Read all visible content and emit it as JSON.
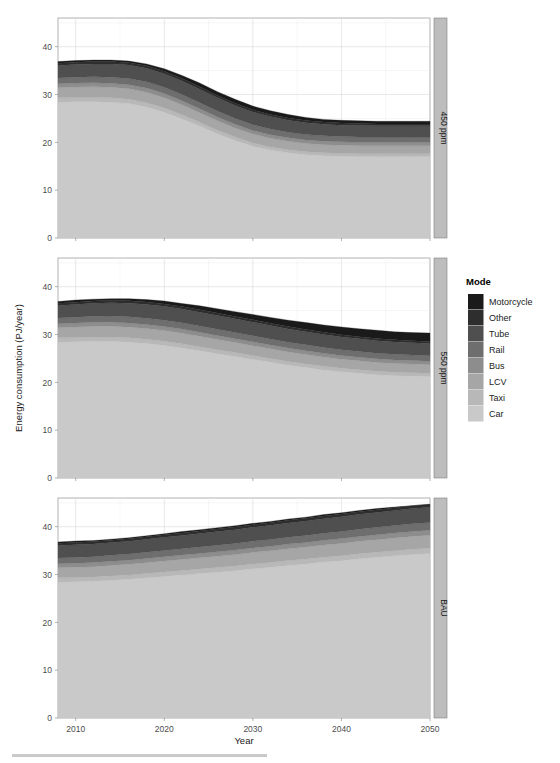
{
  "chart_data": {
    "type": "area",
    "stacked": true,
    "title": "",
    "xlabel": "Year",
    "ylabel": "Energy consumption (PJ/year)",
    "xlim": [
      2008,
      2050
    ],
    "ylim": [
      0,
      46
    ],
    "xticks": [
      2010,
      2020,
      2030,
      2040,
      2050
    ],
    "xtick_labels": [
      "2010",
      "2020",
      "2030",
      "2040",
      "2050"
    ],
    "yticks": [
      0,
      10,
      20,
      30,
      40
    ],
    "ytick_labels": [
      "0",
      "10",
      "20",
      "30",
      "40"
    ],
    "grid": true,
    "legend_title": "Mode",
    "legend_position": "right",
    "facet_labels": [
      "450 ppm",
      "550 ppm",
      "BAU"
    ],
    "facet_strip_side": "right",
    "x": [
      2008,
      2010,
      2012,
      2014,
      2016,
      2018,
      2020,
      2022,
      2024,
      2026,
      2028,
      2030,
      2032,
      2034,
      2036,
      2038,
      2040,
      2042,
      2044,
      2046,
      2048,
      2050
    ],
    "series_order": [
      "Car",
      "Taxi",
      "LCV",
      "Bus",
      "Rail",
      "Tube",
      "Other",
      "Motorcycle"
    ],
    "legend_entries": [
      {
        "label": "Motorcycle",
        "color": "#1a1a1a"
      },
      {
        "label": "Other",
        "color": "#2e2e2e"
      },
      {
        "label": "Tube",
        "color": "#4f4f4f"
      },
      {
        "label": "Rail",
        "color": "#6e6e6e"
      },
      {
        "label": "Bus",
        "color": "#8d8d8d"
      },
      {
        "label": "LCV",
        "color": "#a6a6a6"
      },
      {
        "label": "Taxi",
        "color": "#b8b8b8"
      },
      {
        "label": "Car",
        "color": "#c9c9c9"
      }
    ],
    "panels": [
      {
        "name": "450 ppm",
        "total": [
          36.9,
          37.1,
          37.2,
          37.2,
          37.0,
          36.4,
          35.4,
          34.0,
          32.4,
          30.6,
          29.0,
          27.6,
          26.6,
          25.8,
          25.2,
          24.8,
          24.6,
          24.5,
          24.4,
          24.4,
          24.4,
          24.4
        ],
        "series": [
          {
            "name": "Car",
            "color": "#c9c9c9",
            "values": [
              28.4,
              28.5,
              28.5,
              28.4,
              28.1,
              27.4,
              26.3,
              24.9,
              23.4,
              21.8,
              20.4,
              19.2,
              18.4,
              17.8,
              17.4,
              17.2,
              17.1,
              17.0,
              17.0,
              17.0,
              17.0,
              17.0
            ]
          },
          {
            "name": "Taxi",
            "color": "#b8b8b8",
            "values": [
              0.9,
              0.9,
              0.9,
              0.9,
              0.9,
              0.9,
              0.9,
              0.85,
              0.8,
              0.75,
              0.7,
              0.68,
              0.65,
              0.63,
              0.62,
              0.6,
              0.6,
              0.6,
              0.6,
              0.6,
              0.6,
              0.6
            ]
          },
          {
            "name": "LCV",
            "color": "#a6a6a6",
            "values": [
              2.1,
              2.15,
              2.2,
              2.2,
              2.2,
              2.2,
              2.15,
              2.1,
              2.0,
              1.95,
              1.9,
              1.85,
              1.8,
              1.78,
              1.75,
              1.72,
              1.7,
              1.7,
              1.7,
              1.7,
              1.7,
              1.7
            ]
          },
          {
            "name": "Bus",
            "color": "#8d8d8d",
            "values": [
              0.85,
              0.85,
              0.85,
              0.85,
              0.85,
              0.85,
              0.85,
              0.85,
              0.82,
              0.8,
              0.78,
              0.76,
              0.75,
              0.73,
              0.72,
              0.72,
              0.7,
              0.7,
              0.7,
              0.7,
              0.7,
              0.7
            ]
          },
          {
            "name": "Rail",
            "color": "#6e6e6e",
            "values": [
              1.2,
              1.22,
              1.25,
              1.28,
              1.3,
              1.3,
              1.3,
              1.3,
              1.28,
              1.25,
              1.22,
              1.2,
              1.18,
              1.15,
              1.13,
              1.12,
              1.1,
              1.1,
              1.1,
              1.1,
              1.1,
              1.1
            ]
          },
          {
            "name": "Tube",
            "color": "#4f4f4f",
            "values": [
              2.6,
              2.65,
              2.7,
              2.75,
              2.8,
              2.85,
              2.85,
              2.85,
              2.8,
              2.75,
              2.7,
              2.65,
              2.6,
              2.55,
              2.5,
              2.45,
              2.4,
              2.4,
              2.35,
              2.35,
              2.35,
              2.35
            ]
          },
          {
            "name": "Other",
            "color": "#2e2e2e",
            "values": [
              0.5,
              0.5,
              0.5,
              0.5,
              0.5,
              0.5,
              0.5,
              0.5,
              0.5,
              0.5,
              0.48,
              0.46,
              0.45,
              0.44,
              0.43,
              0.42,
              0.42,
              0.42,
              0.4,
              0.4,
              0.4,
              0.4
            ]
          },
          {
            "name": "Motorcycle",
            "color": "#1a1a1a",
            "values": [
              0.35,
              0.33,
              0.3,
              0.32,
              0.35,
              0.4,
              0.55,
              0.65,
              0.8,
              0.8,
              0.82,
              0.78,
              0.77,
              0.73,
              0.65,
              0.57,
              0.58,
              0.58,
              0.55,
              0.55,
              0.55,
              0.55
            ]
          }
        ]
      },
      {
        "name": "550 ppm",
        "total": [
          36.9,
          37.2,
          37.4,
          37.5,
          37.5,
          37.3,
          37.0,
          36.5,
          36.0,
          35.4,
          34.8,
          34.2,
          33.6,
          33.0,
          32.5,
          32.0,
          31.6,
          31.2,
          30.9,
          30.6,
          30.4,
          30.3
        ],
        "series": [
          {
            "name": "Car",
            "color": "#c9c9c9",
            "values": [
              28.4,
              28.5,
              28.6,
              28.6,
              28.4,
              28.1,
              27.7,
              27.2,
              26.6,
              26.0,
              25.4,
              24.8,
              24.2,
              23.6,
              23.1,
              22.6,
              22.2,
              21.9,
              21.6,
              21.4,
              21.3,
              21.2
            ]
          },
          {
            "name": "Taxi",
            "color": "#b8b8b8",
            "values": [
              0.9,
              0.9,
              0.9,
              0.9,
              0.9,
              0.9,
              0.9,
              0.88,
              0.86,
              0.84,
              0.82,
              0.8,
              0.78,
              0.77,
              0.76,
              0.75,
              0.74,
              0.73,
              0.72,
              0.72,
              0.71,
              0.7
            ]
          },
          {
            "name": "LCV",
            "color": "#a6a6a6",
            "values": [
              2.1,
              2.15,
              2.2,
              2.22,
              2.24,
              2.24,
              2.22,
              2.2,
              2.17,
              2.14,
              2.1,
              2.07,
              2.04,
              2.0,
              1.97,
              1.94,
              1.9,
              1.88,
              1.85,
              1.83,
              1.81,
              1.8
            ]
          },
          {
            "name": "Bus",
            "color": "#8d8d8d",
            "values": [
              0.85,
              0.85,
              0.86,
              0.86,
              0.86,
              0.86,
              0.86,
              0.85,
              0.84,
              0.83,
              0.82,
              0.81,
              0.8,
              0.79,
              0.78,
              0.77,
              0.76,
              0.75,
              0.75,
              0.74,
              0.73,
              0.72
            ]
          },
          {
            "name": "Rail",
            "color": "#6e6e6e",
            "values": [
              1.2,
              1.22,
              1.25,
              1.28,
              1.3,
              1.32,
              1.32,
              1.32,
              1.31,
              1.3,
              1.29,
              1.28,
              1.26,
              1.25,
              1.23,
              1.22,
              1.2,
              1.19,
              1.17,
              1.16,
              1.15,
              1.14
            ]
          },
          {
            "name": "Tube",
            "color": "#4f4f4f",
            "values": [
              2.6,
              2.65,
              2.72,
              2.78,
              2.84,
              2.88,
              2.9,
              2.9,
              2.89,
              2.87,
              2.85,
              2.83,
              2.8,
              2.77,
              2.74,
              2.71,
              2.68,
              2.65,
              2.62,
              2.6,
              2.58,
              2.56
            ]
          },
          {
            "name": "Other",
            "color": "#2e2e2e",
            "values": [
              0.5,
              0.5,
              0.5,
              0.5,
              0.5,
              0.5,
              0.5,
              0.5,
              0.5,
              0.5,
              0.5,
              0.5,
              0.49,
              0.48,
              0.47,
              0.47,
              0.46,
              0.46,
              0.45,
              0.45,
              0.44,
              0.44
            ]
          },
          {
            "name": "Motorcycle",
            "color": "#1a1a1a",
            "values": [
              0.35,
              0.43,
              0.37,
              0.36,
              0.46,
              0.5,
              0.6,
              0.65,
              0.83,
              0.92,
              1.0,
              1.11,
              1.21,
              1.34,
              1.45,
              1.54,
              1.64,
              1.64,
              1.74,
              1.66,
              1.68,
              1.74
            ]
          }
        ]
      },
      {
        "name": "BAU",
        "total": [
          36.8,
          36.9,
          37.0,
          37.3,
          37.6,
          38.0,
          38.4,
          38.8,
          39.3,
          39.7,
          40.1,
          40.6,
          41.0,
          41.5,
          41.9,
          42.4,
          42.8,
          43.3,
          43.7,
          44.0,
          44.3,
          44.5
        ],
        "series": [
          {
            "name": "Car",
            "color": "#c9c9c9",
            "values": [
              28.4,
              28.5,
              28.6,
              28.8,
              29.0,
              29.3,
              29.6,
              29.9,
              30.2,
              30.5,
              30.8,
              31.2,
              31.5,
              31.9,
              32.2,
              32.6,
              32.9,
              33.3,
              33.6,
              33.9,
              34.2,
              34.4
            ]
          },
          {
            "name": "Taxi",
            "color": "#b8b8b8",
            "values": [
              0.9,
              0.9,
              0.9,
              0.91,
              0.92,
              0.93,
              0.94,
              0.95,
              0.96,
              0.97,
              0.98,
              0.99,
              1.0,
              1.01,
              1.02,
              1.03,
              1.04,
              1.05,
              1.06,
              1.07,
              1.08,
              1.09
            ]
          },
          {
            "name": "LCV",
            "color": "#a6a6a6",
            "values": [
              2.1,
              2.12,
              2.15,
              2.18,
              2.21,
              2.24,
              2.27,
              2.3,
              2.33,
              2.36,
              2.39,
              2.42,
              2.45,
              2.48,
              2.51,
              2.54,
              2.57,
              2.6,
              2.63,
              2.66,
              2.69,
              2.72
            ]
          },
          {
            "name": "Bus",
            "color": "#8d8d8d",
            "values": [
              0.85,
              0.85,
              0.86,
              0.87,
              0.88,
              0.89,
              0.9,
              0.91,
              0.92,
              0.93,
              0.94,
              0.95,
              0.96,
              0.97,
              0.98,
              0.99,
              1.0,
              1.01,
              1.02,
              1.03,
              1.04,
              1.05
            ]
          },
          {
            "name": "Rail",
            "color": "#6e6e6e",
            "values": [
              1.2,
              1.21,
              1.23,
              1.25,
              1.27,
              1.29,
              1.31,
              1.33,
              1.35,
              1.37,
              1.39,
              1.41,
              1.43,
              1.45,
              1.47,
              1.49,
              1.51,
              1.53,
              1.55,
              1.57,
              1.59,
              1.61
            ]
          },
          {
            "name": "Tube",
            "color": "#4f4f4f",
            "values": [
              2.6,
              2.62,
              2.64,
              2.67,
              2.7,
              2.73,
              2.76,
              2.79,
              2.82,
              2.85,
              2.88,
              2.91,
              2.94,
              2.97,
              3.0,
              3.03,
              3.06,
              3.09,
              3.12,
              3.15,
              3.18,
              3.21
            ]
          },
          {
            "name": "Other",
            "color": "#2e2e2e",
            "values": [
              0.5,
              0.5,
              0.5,
              0.5,
              0.51,
              0.51,
              0.52,
              0.52,
              0.53,
              0.53,
              0.54,
              0.54,
              0.55,
              0.55,
              0.56,
              0.56,
              0.57,
              0.57,
              0.58,
              0.58,
              0.59,
              0.59
            ]
          },
          {
            "name": "Motorcycle",
            "color": "#1a1a1a",
            "values": [
              0.25,
              0.3,
              0.22,
              0.22,
              0.21,
              0.21,
              0.24,
              0.3,
              0.27,
              0.29,
              0.28,
              0.28,
              0.27,
              0.27,
              0.26,
              0.3,
              0.26,
              0.25,
              0.24,
              0.14,
              0.03,
              0.03
            ]
          }
        ]
      }
    ]
  }
}
